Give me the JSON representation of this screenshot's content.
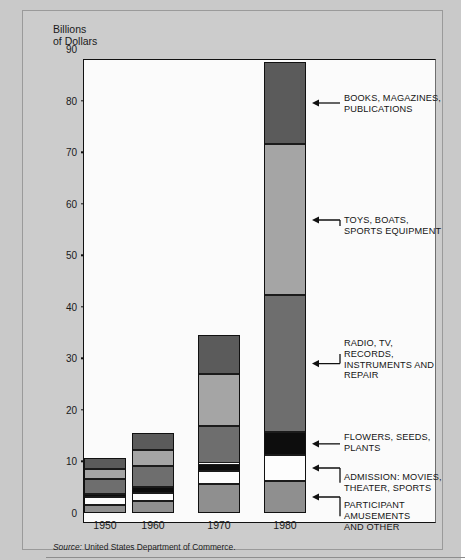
{
  "figure": {
    "axis_title": "Billions\nof Dollars",
    "source": "Source:",
    "source_text": " United States Department of Commerce."
  },
  "chart_data": {
    "type": "bar",
    "stacked": true,
    "title": "",
    "xlabel": "",
    "ylabel": "Billions of Dollars",
    "ylim": [
      0,
      90
    ],
    "yticks": [
      0,
      10,
      20,
      30,
      40,
      50,
      60,
      70,
      80,
      90
    ],
    "grid": false,
    "legend": "right-callouts",
    "categories": [
      "1950",
      "1960",
      "1970",
      "1980"
    ],
    "series": [
      {
        "name": "PARTICIPANT\nAMUSEMENTS\nAND OTHER",
        "color": "#8f8f8f",
        "values": [
          1.6,
          2.3,
          5.7,
          6.2
        ]
      },
      {
        "name": "ADMISSION: MOVIES,\nTHEATER, SPORTS",
        "color": "#fdfdfd",
        "values": [
          1.5,
          1.6,
          2.5,
          5.0
        ]
      },
      {
        "name": "FLOWERS, SEEDS,\nPLANTS",
        "color": "#0d0d0d",
        "values": [
          0.5,
          1.1,
          1.4,
          4.5
        ]
      },
      {
        "name": "RADIO, TV, RECORDS,\nINSTRUMENTS AND\nREPAIR",
        "color": "#6e6e6e",
        "values": [
          2.9,
          4.1,
          7.3,
          26.5
        ]
      },
      {
        "name": "TOYS, BOATS,\nSPORTS EQUIPMENT",
        "color": "#a5a5a5",
        "values": [
          2.0,
          3.1,
          10.1,
          29.3
        ]
      },
      {
        "name": "BOOKS, MAGAZINES,\nPUBLICATIONS",
        "color": "#5b5b5b",
        "values": [
          2.2,
          3.3,
          7.5,
          16.0
        ]
      }
    ],
    "totals": [
      10.7,
      15.5,
      34.5,
      87.5
    ]
  }
}
